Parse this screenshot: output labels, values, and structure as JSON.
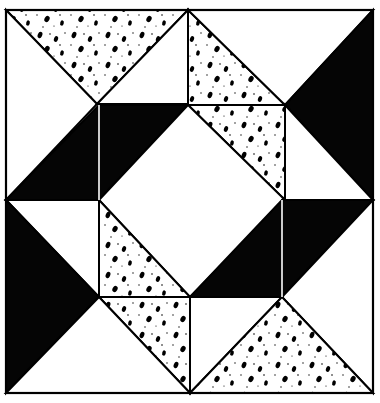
{
  "figure": {
    "colors": {
      "background": "#ffffff",
      "outline": "#000000",
      "solid": "#050505",
      "speckle_fill": "#ffffff",
      "speckle_dot": "#000000"
    },
    "frame": {
      "x": 6,
      "y": 10,
      "width": 367,
      "height": 383
    },
    "pieces": [
      {
        "id": "top-speckled-triangle",
        "fill": "speckle",
        "points": "6,10 188,10 97,104"
      },
      {
        "id": "top-left-white-triangle",
        "fill": "white",
        "points": "6,10 97,104 6,200"
      },
      {
        "id": "top-center-white-triangle",
        "fill": "white",
        "points": "188,10 97,104 188,104"
      },
      {
        "id": "top-right-speckled-band-upper",
        "fill": "speckle",
        "points": "188,10 285,105 188,105"
      },
      {
        "id": "top-right-white-triangle",
        "fill": "white",
        "points": "188,10 373,10 285,105"
      },
      {
        "id": "right-black-triangle",
        "fill": "solid",
        "points": "373,10 373,200 285,105"
      },
      {
        "id": "right-speckled-band-lower",
        "fill": "speckle",
        "points": "188,105 285,105 285,200"
      },
      {
        "id": "left-black-parallelogram-a",
        "fill": "solid",
        "points": "6,200 99,105 99,200"
      },
      {
        "id": "left-black-parallelogram-b",
        "fill": "solid",
        "points": "99,105 188,105 99,200"
      },
      {
        "id": "center-white-diamond",
        "fill": "white",
        "points": "188,105 285,200 190,297 99,200"
      },
      {
        "id": "right-white-triangle-lower",
        "fill": "white",
        "points": "285,105 373,200 285,200"
      },
      {
        "id": "left-white-triangle-lower",
        "fill": "white",
        "points": "6,200 99,200 99,297"
      },
      {
        "id": "left-black-triangle",
        "fill": "solid",
        "points": "6,200 99,297 6,393"
      },
      {
        "id": "left-speckled-band-upper",
        "fill": "speckle",
        "points": "99,200 190,297 99,297"
      },
      {
        "id": "right-black-parallelogram-a",
        "fill": "solid",
        "points": "190,297 282,200 282,297"
      },
      {
        "id": "right-black-parallelogram-b",
        "fill": "solid",
        "points": "282,200 373,200 282,297"
      },
      {
        "id": "left-speckled-band-lower",
        "fill": "speckle",
        "points": "99,297 190,297 190,393"
      },
      {
        "id": "bottom-left-white-triangle",
        "fill": "white",
        "points": "6,393 99,297 190,393"
      },
      {
        "id": "bottom-right-white-triangle",
        "fill": "white",
        "points": "282,297 373,200 373,393"
      },
      {
        "id": "bottom-center-white-triangle",
        "fill": "white",
        "points": "190,297 282,297 190,393"
      },
      {
        "id": "bottom-speckled-triangle",
        "fill": "speckle",
        "points": "190,393 282,297 373,393"
      }
    ],
    "seams": [
      {
        "id": "seam-left-vertical",
        "x1": 99,
        "y1": 105,
        "x2": 99,
        "y2": 200,
        "color": "#ffffff"
      },
      {
        "id": "seam-right-vertical",
        "x1": 282,
        "y1": 200,
        "x2": 282,
        "y2": 297,
        "color": "#ffffff"
      }
    ]
  }
}
